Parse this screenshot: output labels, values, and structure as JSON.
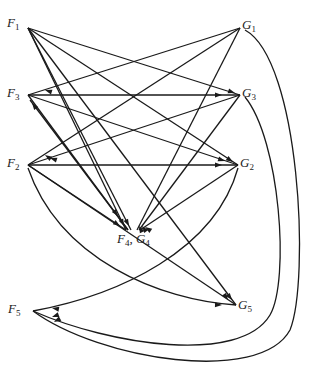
{
  "diagram": {
    "type": "directed-graph",
    "nodes": [
      {
        "id": "F1",
        "label": "F",
        "sub": "1",
        "x": 28,
        "y": 28,
        "lx": 7,
        "ly": 16
      },
      {
        "id": "F3",
        "label": "F",
        "sub": "3",
        "x": 28,
        "y": 95,
        "lx": 7,
        "ly": 86
      },
      {
        "id": "F2",
        "label": "F",
        "sub": "2",
        "x": 28,
        "y": 165,
        "lx": 7,
        "ly": 156
      },
      {
        "id": "F5",
        "label": "F",
        "sub": "5",
        "x": 33,
        "y": 311,
        "lx": 8,
        "ly": 302
      },
      {
        "id": "G1",
        "label": "G",
        "sub": "1",
        "x": 240,
        "y": 28,
        "lx": 242,
        "ly": 18
      },
      {
        "id": "G3",
        "label": "G",
        "sub": "3",
        "x": 240,
        "y": 95,
        "lx": 242,
        "ly": 86
      },
      {
        "id": "G2",
        "label": "G",
        "sub": "2",
        "x": 238,
        "y": 165,
        "lx": 240,
        "ly": 156
      },
      {
        "id": "G5",
        "label": "G",
        "sub": "5",
        "x": 236,
        "y": 305,
        "lx": 238,
        "ly": 298
      },
      {
        "id": "F4G4",
        "label": "F",
        "sub": "4",
        "label2": "G",
        "sub2": "4",
        "x": 132,
        "y": 230,
        "lx": 117,
        "ly": 232
      }
    ],
    "edges": [
      {
        "d": "M28,28 L240,95",
        "arrow_at": [
          235,
          93,
          -18
        ]
      },
      {
        "d": "M28,28 L238,165",
        "arrow_at": [
          233,
          162,
          -33
        ]
      },
      {
        "d": "M28,28 L236,305",
        "arrow_at": [
          232,
          300,
          -53
        ]
      },
      {
        "d": "M28,28 L126,230",
        "arrow_at": [
          124,
          226,
          -64
        ]
      },
      {
        "d": "M28,28 L131,230",
        "arrow_at": [
          129,
          226,
          -63
        ]
      },
      {
        "d": "M240,28 L28,95",
        "arrow_at": [
          45,
          90,
          163
        ]
      },
      {
        "d": "M240,28 L28,165",
        "arrow_at": [
          45,
          155,
          147
        ]
      },
      {
        "d": "M240,28 L137,230",
        "arrow_at": [
          139,
          226,
          117
        ]
      },
      {
        "d": "M28,95 L240,95",
        "arrow_at": [
          222,
          95,
          0
        ]
      },
      {
        "d": "M28,95 L238,165",
        "arrow_at": [
          225,
          161,
          -18
        ]
      },
      {
        "d": "M28,95 L128,230",
        "arrow_at": [
          118,
          216,
          -53
        ]
      },
      {
        "d": "M128,230 L30,100",
        "arrow_at": [
          32,
          103,
          127
        ]
      },
      {
        "d": "M240,95 L28,165",
        "arrow_at": [
          50,
          158,
          162
        ]
      },
      {
        "d": "M240,95 L139,230",
        "arrow_at": [
          142,
          226,
          127
        ]
      },
      {
        "d": "M28,165 L238,165",
        "arrow_at": [
          222,
          165,
          0
        ]
      },
      {
        "d": "M28,165 L126,230",
        "arrow_at": [
          120,
          226,
          -34
        ]
      },
      {
        "d": "M28,165 L236,305",
        "arrow_at": [
          228,
          300,
          -56
        ]
      },
      {
        "d": "M238,165 L140,230",
        "arrow_at": [
          145,
          227,
          146
        ]
      },
      {
        "d": "M28,168 C60,260 160,300 236,305",
        "arrow_at": [
          222,
          305,
          -2
        ]
      },
      {
        "d": "M238,168 C215,250 120,295 33,311",
        "arrow_at": [
          52,
          308,
          170
        ]
      },
      {
        "d": "M245,97 C280,140 290,280 270,315 C240,365 110,345 33,311",
        "arrow_at": [
          52,
          317,
          -160
        ]
      },
      {
        "d": "M245,30 C300,60 310,280 290,330 C260,385 100,360 33,311",
        "arrow_at": [
          54,
          322,
          -150
        ]
      }
    ]
  }
}
